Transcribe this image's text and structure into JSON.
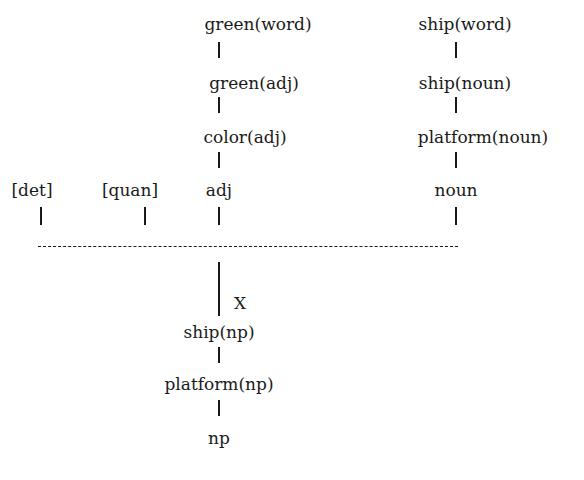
{
  "diagram": {
    "cutoff_text": "",
    "adj_chain": [
      "green(word)",
      "green(adj)",
      "color(adj)",
      "adj"
    ],
    "noun_chain": [
      "ship(word)",
      "ship(noun)",
      "platform(noun)",
      "noun"
    ],
    "optional": [
      "[det]",
      "[quan]"
    ],
    "rule_label": "X",
    "result_chain": [
      "ship(np)",
      "platform(np)",
      "np"
    ]
  }
}
